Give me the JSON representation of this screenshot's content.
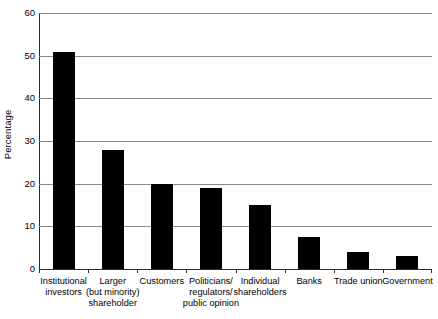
{
  "chart_data": {
    "type": "bar",
    "title": "",
    "subtitle": "",
    "xlabel": "",
    "ylabel": "Percentage",
    "ylim": [
      0,
      60
    ],
    "yticks": [
      0,
      10,
      20,
      30,
      40,
      50,
      60
    ],
    "ytick_labels": [
      "0",
      "10",
      "20",
      "30",
      "40",
      "50",
      "60"
    ],
    "grid": true,
    "legend": false,
    "legend_position": "none",
    "bar_color": "#000000",
    "gridline_color": "#8a8a8a",
    "axis_color": "#2b2b2b",
    "categories": [
      "Institutional investors",
      "Larger (but minority) shareholder",
      "Customers",
      "Politicians/ regulators/ public opinion",
      "Individual shareholders",
      "Banks",
      "Trade union",
      "Government"
    ],
    "category_lines": [
      [
        "Institutional",
        "investors"
      ],
      [
        "Larger",
        "(but minority)",
        "shareholder"
      ],
      [
        "Customers"
      ],
      [
        "Politicians/",
        "regulators/",
        "public opinion"
      ],
      [
        "Individual",
        "shareholders"
      ],
      [
        "Banks"
      ],
      [
        "Trade union"
      ],
      [
        "Government"
      ]
    ],
    "values": [
      50.8,
      28.0,
      20.0,
      19.0,
      15.0,
      7.5,
      4.0,
      3.0
    ]
  }
}
